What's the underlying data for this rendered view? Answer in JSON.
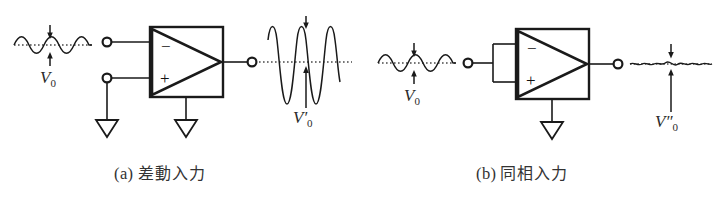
{
  "figure": {
    "title": "",
    "background_color": "#ffffff",
    "line_color": "#1a1a1a",
    "width": 723,
    "height": 204
  },
  "panels": [
    {
      "id": "panel-a",
      "caption_index": "(a)",
      "caption_text": "差動入力",
      "caption_full": "(a) 差動入力",
      "input_label": "V",
      "input_label_sub": "0",
      "input_label_prime": "",
      "output_label": "V",
      "output_label_sub": "0",
      "output_label_prime": "′",
      "opamp": {
        "minus_sign": "−",
        "plus_sign": "+",
        "input_count": 2,
        "grounded_inputs": 1,
        "ground_symbols": 2
      },
      "input_waveform": {
        "type": "sine",
        "cycles": 2,
        "amplitude_px": 9,
        "description": "small-amplitude sine on dotted baseline"
      },
      "output_waveform": {
        "type": "sine",
        "cycles": 2.5,
        "amplitude_px": 44,
        "description": "large-amplitude amplified sine on dotted baseline"
      }
    },
    {
      "id": "panel-b",
      "caption_index": "(b)",
      "caption_text": "同相入力",
      "caption_full": "(b) 同相入力",
      "input_label": "V",
      "input_label_sub": "0",
      "input_label_prime": "",
      "output_label": "V",
      "output_label_sub": "0",
      "output_label_prime": "″",
      "opamp": {
        "minus_sign": "−",
        "plus_sign": "+",
        "input_count": 2,
        "inputs_tied_together": true,
        "ground_symbols": 1
      },
      "input_waveform": {
        "type": "sine",
        "cycles": 2,
        "amplitude_px": 9,
        "description": "small-amplitude sine on dotted baseline"
      },
      "output_waveform": {
        "type": "ripple",
        "cycles": 6,
        "amplitude_px": 2.5,
        "description": "near-flat tiny ripple on dotted baseline"
      }
    }
  ],
  "symbols": {
    "terminal": "open-circle",
    "ground": "open-downward-triangle",
    "opamp_shape": "triangle-in-square"
  }
}
